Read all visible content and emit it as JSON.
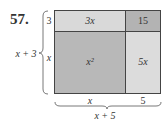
{
  "problem_number": "57.",
  "regions": {
    "top_left": {
      "label": "3x",
      "color": "#d9d9d9"
    },
    "top_right": {
      "label": "15",
      "color": "#b3b3b3"
    },
    "bottom_left": {
      "label": "x²",
      "color": "#b8b8b8"
    },
    "bottom_right": {
      "label": "5x",
      "color": "#dcdcdc"
    }
  },
  "side_labels": {
    "left_top": "3",
    "left_bottom": "x",
    "left_total": "x + 3",
    "bottom_left": "x",
    "bottom_right": "5",
    "bottom_total": "x + 5"
  }
}
